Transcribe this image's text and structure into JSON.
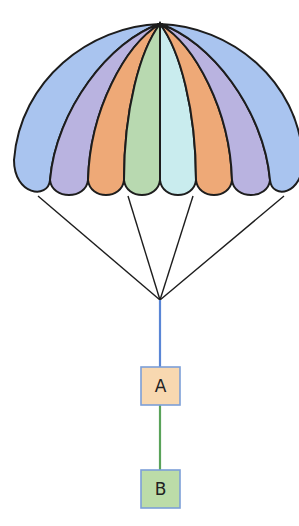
{
  "diagram": {
    "type": "parachute",
    "canopy": {
      "gore_count": 8,
      "gore_colors": [
        "#a9c4ef",
        "#b9b3e0",
        "#eea977",
        "#b8d9b0",
        "#c9ecee",
        "#eea977",
        "#b9b3e0",
        "#a9c4ef"
      ],
      "outline_color": "#1d1d1d"
    },
    "suspension_lines": {
      "count": 4,
      "color": "#1d1d1d"
    },
    "connectors": [
      {
        "from": "parachute",
        "to": "A",
        "color": "#5a86d6"
      },
      {
        "from": "A",
        "to": "B",
        "color": "#5aa35a"
      }
    ],
    "boxes": [
      {
        "id": "A",
        "label": "A",
        "fill": "#f8d8b0",
        "border": "#7c9fd8"
      },
      {
        "id": "B",
        "label": "B",
        "fill": "#bcdca8",
        "border": "#7c9fd8"
      }
    ]
  }
}
